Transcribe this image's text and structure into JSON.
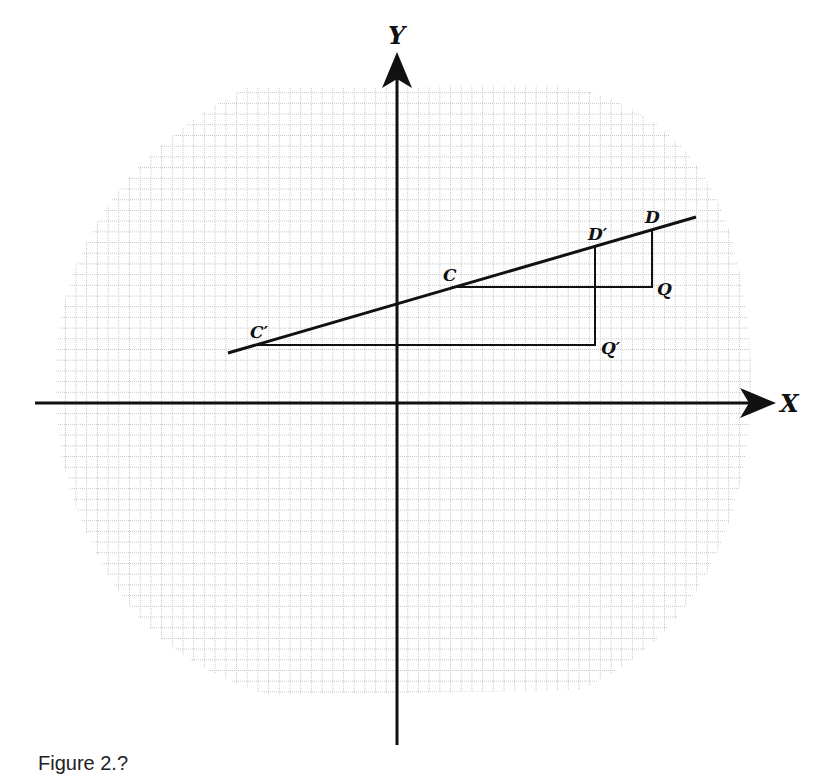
{
  "figure": {
    "axes": {
      "x_label": "X",
      "y_label": "Y"
    },
    "points": {
      "C": "C",
      "C_prime": "C′",
      "D": "D",
      "D_prime": "D′",
      "Q": "Q",
      "Q_prime": "Q′"
    },
    "coords_grid_units": {
      "C": [
        3.9,
        8.3
      ],
      "D": [
        18.0,
        12.2
      ],
      "C_prime": [
        -10.0,
        4.0
      ],
      "D_prime": [
        14.0,
        11.2
      ],
      "Q": [
        18.0,
        8.3
      ],
      "Q_prime": [
        14.0,
        4.0
      ],
      "y_intercept": 7.0
    },
    "caption": "Figure 2.?"
  },
  "colors": {
    "ink": "#111111",
    "grid": "#c8c8c8"
  }
}
